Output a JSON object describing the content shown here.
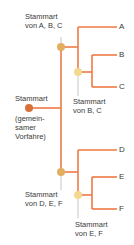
{
  "diagram": {
    "type": "phylogenetic-tree",
    "colors": {
      "branch": "#ee7a45",
      "root_node": "#d9703a",
      "internal_node_dark": "#e0b060",
      "internal_node_light": "#f4d890",
      "connector_gray": "#b8b8b8",
      "text": "#3a3a3a"
    },
    "root": {
      "label_line1": "Stammart",
      "label_line2": "(gemein-",
      "label_line3": "samer",
      "label_line4": "Vorfahre)"
    },
    "nodes": {
      "abc": {
        "line1": "Stammart",
        "line2": "von A, B, C"
      },
      "bc": {
        "line1": "Stammart",
        "line2": "von B, C"
      },
      "def": {
        "line1": "Stammart",
        "line2": "von D, E, F"
      },
      "ef": {
        "line1": "Stammart",
        "line2": "von E, F"
      }
    },
    "leaves": [
      "A",
      "B",
      "C",
      "D",
      "E",
      "F"
    ]
  }
}
